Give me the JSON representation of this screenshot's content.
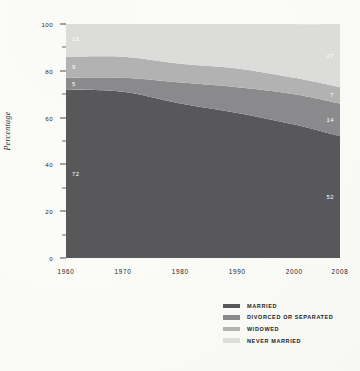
{
  "figure": {
    "background_color": "#fbfbf8"
  },
  "chart_data": {
    "type": "area",
    "stacked": true,
    "title": "",
    "subtitle": "",
    "xlabel": "",
    "ylabel": "Percentage",
    "x": [
      1960,
      1970,
      1980,
      1990,
      2000,
      2008
    ],
    "xticklabels": [
      "1960",
      "1970",
      "1980",
      "1990",
      "2000",
      "2008"
    ],
    "ylim": [
      0,
      100
    ],
    "yticks": [
      0,
      20,
      40,
      60,
      80,
      100
    ],
    "yticklabels": [
      "0",
      "20",
      "40",
      "60",
      "80",
      "100"
    ],
    "yminorticks": [
      10,
      30,
      50,
      70,
      90
    ],
    "grid": false,
    "legend_position": "bottom-right",
    "series": [
      {
        "name": "MARRIED",
        "color": "#58585a",
        "values": [
          72,
          71,
          66,
          62,
          57,
          52
        ]
      },
      {
        "name": "DIVORCED OR SEPARATED",
        "color": "#8a8a8c",
        "values": [
          5,
          6,
          9,
          11,
          13,
          14
        ]
      },
      {
        "name": "WIDOWED",
        "color": "#b2b2b3",
        "values": [
          9,
          9,
          8,
          8,
          7,
          7
        ]
      },
      {
        "name": "NEVER MARRIED",
        "color": "#dcdcda",
        "values": [
          15,
          15,
          18,
          20,
          23,
          27
        ]
      }
    ],
    "point_labels": {
      "left": [
        {
          "series": "NEVER MARRIED",
          "value": "15"
        },
        {
          "series": "WIDOWED",
          "value": "9"
        },
        {
          "series": "DIVORCED OR SEPARATED",
          "value": "5"
        },
        {
          "series": "MARRIED",
          "value": "72"
        }
      ],
      "right": [
        {
          "series": "NEVER MARRIED",
          "value": "27"
        },
        {
          "series": "WIDOWED",
          "value": "7"
        },
        {
          "series": "DIVORCED OR SEPARATED",
          "value": "14"
        },
        {
          "series": "MARRIED",
          "value": "52"
        }
      ]
    }
  },
  "legend": {
    "items": [
      {
        "label": "MARRIED",
        "color": "#58585a"
      },
      {
        "label": "DIVORCED OR SEPARATED",
        "color": "#8a8a8c"
      },
      {
        "label": "WIDOWED",
        "color": "#b2b2b3"
      },
      {
        "label": "NEVER MARRIED",
        "color": "#dcdcda"
      }
    ]
  }
}
